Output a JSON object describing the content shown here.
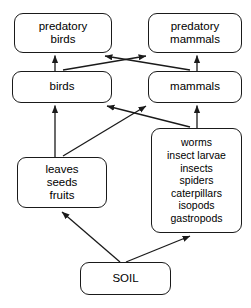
{
  "diagram": {
    "type": "food-web",
    "line_color": "#1a1a1a",
    "background_color": "#ffffff"
  },
  "nodes": [
    {
      "id": "predatory-birds",
      "name": "predatory-birds-node",
      "trophic_level": "tertiary consumers",
      "lines": [
        "predatory",
        "birds"
      ]
    },
    {
      "id": "predatory-mammals",
      "name": "predatory-mammals-node",
      "trophic_level": "tertiary consumers",
      "lines": [
        "predatory",
        "mammals"
      ]
    },
    {
      "id": "birds",
      "name": "birds-node",
      "trophic_level": "secondary consumers",
      "lines": [
        "birds"
      ]
    },
    {
      "id": "mammals",
      "name": "mammals-node",
      "trophic_level": "secondary consumers",
      "lines": [
        "mammals"
      ]
    },
    {
      "id": "detritivores",
      "name": "invertebrates-node",
      "trophic_level": "primary consumers",
      "lines": [
        "worms",
        "insect larvae",
        "insects",
        "spiders",
        "caterpillars",
        "isopods",
        "gastropods"
      ]
    },
    {
      "id": "plants",
      "name": "plant-matter-node",
      "trophic_level": "producers",
      "lines": [
        "leaves",
        "seeds",
        "fruits"
      ]
    },
    {
      "id": "soil",
      "name": "soil-node",
      "trophic_level": "abiotic source",
      "lines": [
        "SOIL"
      ]
    }
  ],
  "edges": [
    {
      "id": "birds-to-predatory-birds",
      "from": "birds",
      "to": "predatory-birds",
      "shape": "vertical"
    },
    {
      "id": "birds-to-predatory-mammals",
      "from": "birds",
      "to": "predatory-mammals",
      "shape": "diagonal"
    },
    {
      "id": "mammals-to-predatory-mammals",
      "from": "mammals",
      "to": "predatory-mammals",
      "shape": "vertical"
    },
    {
      "id": "mammals-to-predatory-birds",
      "from": "mammals",
      "to": "predatory-birds",
      "shape": "diagonal"
    },
    {
      "id": "plants-to-birds",
      "from": "plants",
      "to": "birds",
      "shape": "vertical"
    },
    {
      "id": "plants-to-mammals",
      "from": "plants",
      "to": "mammals",
      "shape": "diagonal"
    },
    {
      "id": "detritivores-to-mammals",
      "from": "detritivores",
      "to": "mammals",
      "shape": "vertical"
    },
    {
      "id": "detritivores-to-birds",
      "from": "detritivores",
      "to": "birds",
      "shape": "diagonal"
    },
    {
      "id": "soil-to-plants",
      "from": "soil",
      "to": "plants",
      "shape": "diagonal"
    },
    {
      "id": "soil-to-detritivores",
      "from": "soil",
      "to": "detritivores",
      "shape": "diagonal"
    }
  ]
}
